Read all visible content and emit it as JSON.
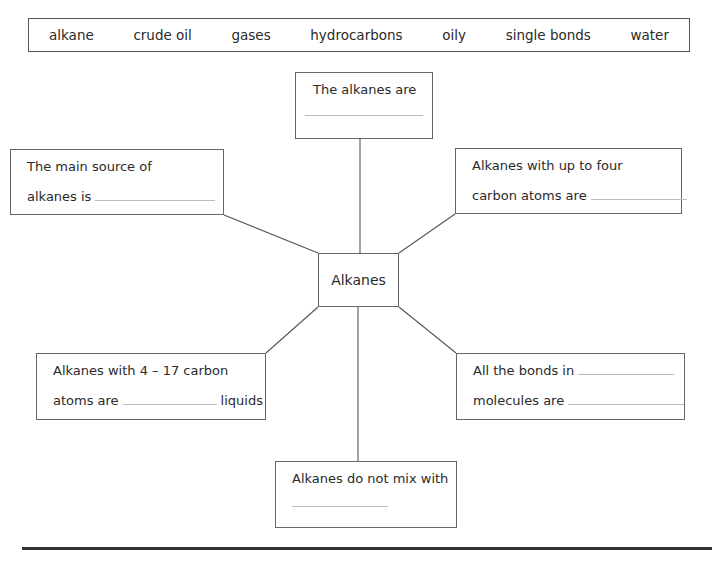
{
  "word_bank": [
    "alkane",
    "crude oil",
    "gases",
    "hydrocarbons",
    "oily",
    "single bonds",
    "water"
  ],
  "center": {
    "label": "Alkanes"
  },
  "boxes": {
    "top": {
      "line1": "The alkanes are"
    },
    "left_top": {
      "line1": "The main source of",
      "line2": "alkanes is"
    },
    "right_top": {
      "line1": "Alkanes with up to four",
      "line2": "carbon atoms are"
    },
    "left_bottom": {
      "line1": "Alkanes with 4 – 17 carbon",
      "line2_prefix": "atoms are",
      "line2_suffix": "liquids"
    },
    "right_bottom": {
      "line1": "All the bonds in",
      "line2": "molecules are"
    },
    "bottom": {
      "line1": "Alkanes do not mix with"
    }
  }
}
